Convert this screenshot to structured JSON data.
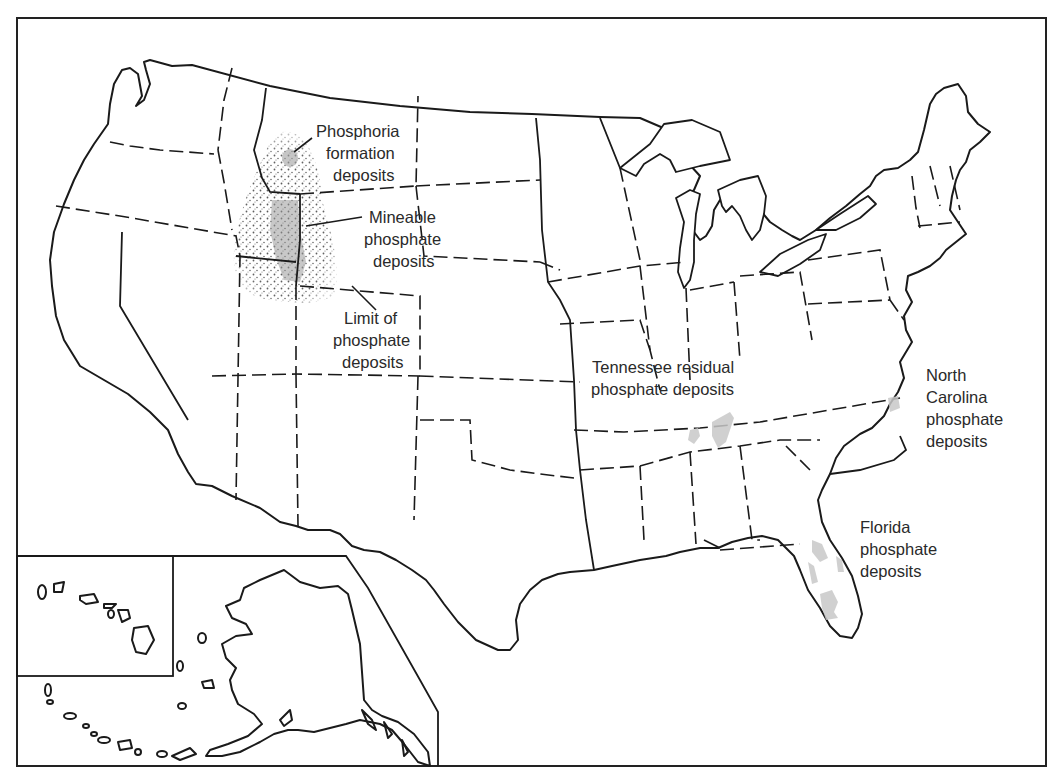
{
  "map": {
    "subject": "Phosphate deposits of the United States",
    "labels": {
      "phosphoria": [
        "Phosphoria",
        "formation",
        "deposits"
      ],
      "mineable": [
        "Mineable",
        "phosphate",
        "deposits"
      ],
      "limit": [
        "Limit of",
        "phosphate",
        "deposits"
      ],
      "tennessee": [
        "Tennessee residual",
        "phosphate deposits"
      ],
      "north_carolina": [
        "North",
        "Carolina",
        "phosphate",
        "deposits"
      ],
      "florida": [
        "Florida",
        "phosphate",
        "deposits"
      ]
    },
    "insets": [
      "Hawaii",
      "Alaska"
    ],
    "colors": {
      "outline": "#1a1a1a",
      "deposit_fill": "#c8c8c8",
      "stipple": "#333333",
      "background": "#ffffff"
    }
  }
}
